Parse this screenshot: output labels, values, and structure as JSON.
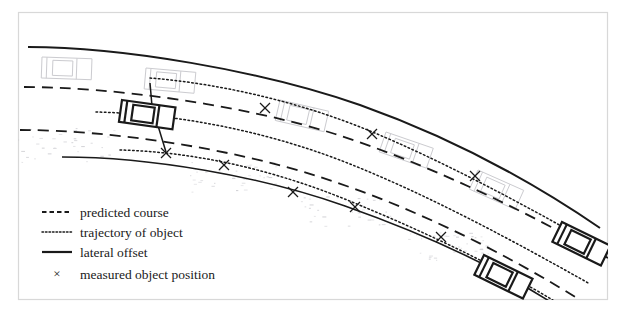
{
  "figure": {
    "background_color": "#ffffff",
    "frame_color": "#d8d8d8",
    "line_color": "#1a1a1a",
    "ghost_color": "#c3c3c8",
    "frame": {
      "x": 18,
      "y": 12,
      "width": 590,
      "height": 288
    }
  },
  "legend": {
    "entries": [
      {
        "id": "predicted-course",
        "label": "predicted course",
        "style": "dashed",
        "sample_x1": 42,
        "sample_x2": 72,
        "y": 212
      },
      {
        "id": "trajectory-of-object",
        "label": "trajectory of object",
        "style": "dotted",
        "sample_x1": 42,
        "sample_x2": 72,
        "y": 232
      },
      {
        "id": "lateral-offset",
        "label": "lateral offset",
        "style": "solid",
        "sample_x1": 42,
        "sample_x2": 72,
        "y": 252
      },
      {
        "id": "measured-object-position",
        "label": "measured object position",
        "style": "x-marker",
        "sample_x1": 57,
        "sample_x2": 57,
        "y": 274
      }
    ],
    "label_x": 80,
    "marker_glyph": "×"
  },
  "chart_data": {
    "type": "diagram",
    "road_edges": [
      {
        "id": "road-edge-upper",
        "style": "solid",
        "width": 2.0,
        "path": "M 28,47 C 120,47 260,70 360,105 C 450,137 530,180 600,228"
      },
      {
        "id": "road-edge-lower",
        "style": "solid",
        "width": 1.6,
        "path": "M 62,157 C 150,157 260,176 345,206 C 430,236 505,272 560,308"
      }
    ],
    "predicted_course": [
      {
        "id": "predicted-course-upper",
        "style": "dashed",
        "width": 1.8,
        "dash": "11,7",
        "path": "M 24,87 C 110,87 240,104 335,134 C 425,163 520,208 608,258"
      },
      {
        "id": "predicted-course-lower",
        "style": "dashed",
        "width": 1.8,
        "dash": "11,7",
        "path": "M 20,130 C 110,130 230,148 320,177 C 410,206 500,250 580,300"
      }
    ],
    "object_trajectories": [
      {
        "id": "trajectory-upper",
        "style": "dotted",
        "width": 1.5,
        "dash": "1.6,2.6",
        "path": "M 150,78 C 225,84 305,104 370,131 C 440,160 520,202 600,248"
      },
      {
        "id": "trajectory-middle",
        "style": "dotted",
        "width": 1.5,
        "dash": "1.6,2.6",
        "path": "M 96,112 C 185,114 275,134 350,164 C 430,196 512,240 590,284"
      },
      {
        "id": "trajectory-lower",
        "style": "dotted",
        "width": 1.5,
        "dash": "1.6,2.6",
        "path": "M 120,150 C 200,152 280,172 352,202 C 430,234 500,268 556,302"
      }
    ],
    "lateral_offset": {
      "id": "lateral-offset-line",
      "style": "solid",
      "width": 1.5,
      "path": "M 150,83 L 152,106 L 166,152"
    },
    "measured_positions": [
      {
        "id": "x-1",
        "x": 265,
        "y": 108
      },
      {
        "id": "x-2",
        "x": 372,
        "y": 134
      },
      {
        "id": "x-3",
        "x": 475,
        "y": 176
      },
      {
        "id": "x-4",
        "x": 166,
        "y": 153
      },
      {
        "id": "x-5",
        "x": 224,
        "y": 165
      },
      {
        "id": "x-6",
        "x": 293,
        "y": 192
      },
      {
        "id": "x-7",
        "x": 355,
        "y": 207
      },
      {
        "id": "x-8",
        "x": 441,
        "y": 237
      },
      {
        "id": "x-9",
        "x": 514,
        "y": 278
      }
    ],
    "ego_vehicle": {
      "id": "ego-vehicle",
      "x": 122,
      "y": 100,
      "width": 54,
      "height": 22,
      "rotation": 8,
      "color": "#1a1a1a"
    },
    "target_vehicles": [
      {
        "id": "target-vehicle-right",
        "x": 562,
        "y": 222,
        "width": 54,
        "height": 22,
        "rotation": 26,
        "color": "#1a1a1a"
      },
      {
        "id": "target-vehicle-bottom",
        "x": 484,
        "y": 255,
        "width": 54,
        "height": 22,
        "rotation": 26,
        "color": "#1a1a1a"
      }
    ],
    "ghost_vehicles": [
      {
        "id": "ghost-vehicle-1",
        "x": 42,
        "y": 57,
        "width": 50,
        "height": 21,
        "rotation": 2
      },
      {
        "id": "ghost-vehicle-2",
        "x": 146,
        "y": 68,
        "width": 50,
        "height": 21,
        "rotation": 5
      },
      {
        "id": "ghost-vehicle-3",
        "x": 280,
        "y": 100,
        "width": 50,
        "height": 21,
        "rotation": 13
      },
      {
        "id": "ghost-vehicle-4",
        "x": 386,
        "y": 132,
        "width": 50,
        "height": 21,
        "rotation": 19
      },
      {
        "id": "ghost-vehicle-5",
        "x": 478,
        "y": 170,
        "width": 50,
        "height": 21,
        "rotation": 24
      }
    ],
    "ghost_texture_patches": [
      {
        "id": "texture-patch-left",
        "x": 14,
        "y": 128,
        "width": 100,
        "height": 34
      },
      {
        "id": "texture-patch-center",
        "x": 186,
        "y": 162,
        "width": 90,
        "height": 30
      },
      {
        "id": "texture-patch-right",
        "x": 300,
        "y": 196,
        "width": 90,
        "height": 30
      },
      {
        "id": "texture-patch-far-right",
        "x": 408,
        "y": 232,
        "width": 80,
        "height": 28
      }
    ]
  }
}
